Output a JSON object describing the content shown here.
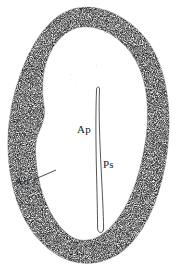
{
  "figure": {
    "type": "line-drawing",
    "background_color": "#ffffff",
    "ink_color": "#1a1a1a",
    "stipple_color": "#4a4a4a",
    "labels": [
      {
        "id": "ap",
        "text": "Ap",
        "x": 77,
        "y": 124,
        "leader": false
      },
      {
        "id": "ps",
        "text": "Ps",
        "x": 103,
        "y": 159,
        "leader": false
      },
      {
        "id": "ao",
        "text": "Ao",
        "x": 15,
        "y": 176,
        "leader": true
      }
    ],
    "leader_line": {
      "from_x": 33,
      "from_y": 180,
      "to_x": 56,
      "to_y": 170
    },
    "structures": {
      "outer_wall_name": "Ao",
      "inner_cavity_name": "Ap",
      "central_slit_name": "Ps"
    },
    "central_slit": {
      "top_y": 88,
      "bottom_y": 232,
      "top_x": 100,
      "bottom_x": 104
    }
  }
}
